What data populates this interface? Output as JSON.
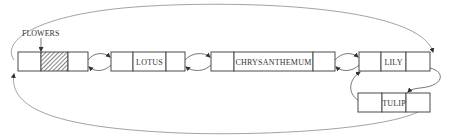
{
  "diagram": {
    "head_label": "FLOWERS",
    "nodes": [
      {
        "id": "head",
        "label": "",
        "hatched": true
      },
      {
        "id": "lotus",
        "label": "LOTUS"
      },
      {
        "id": "chrysanthemum",
        "label": "CHRYSANTHEMUM"
      },
      {
        "id": "lily",
        "label": "LILY"
      },
      {
        "id": "tulip",
        "label": "TULIP"
      }
    ],
    "colors": {
      "line": "#4a4a4a",
      "arc": "#8a8a8a",
      "text": "#333333",
      "background": "#ffffff"
    }
  }
}
